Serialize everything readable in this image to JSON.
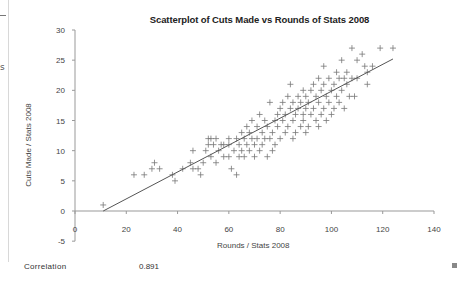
{
  "chart_data": {
    "type": "scatter",
    "title": "Scatterplot of Cuts Made vs Rounds of Stats 2008",
    "xlabel": "Rounds / Stats 2008",
    "ylabel": "Cuts Made / Stats 2008",
    "xlim": [
      0,
      140
    ],
    "ylim": [
      -5,
      30
    ],
    "xticks": [
      0,
      20,
      40,
      60,
      80,
      100,
      120,
      140
    ],
    "yticks": [
      -5,
      0,
      5,
      10,
      15,
      20,
      25,
      30
    ],
    "grid": false,
    "legend": null,
    "marker": "plus",
    "trendline": {
      "x": [
        11,
        124
      ],
      "y": [
        0,
        25.2
      ]
    },
    "points": [
      [
        11,
        1
      ],
      [
        23,
        6
      ],
      [
        27,
        6
      ],
      [
        30,
        7
      ],
      [
        31,
        8
      ],
      [
        33,
        7
      ],
      [
        38,
        6
      ],
      [
        39,
        5
      ],
      [
        42,
        7
      ],
      [
        45,
        8
      ],
      [
        46,
        10
      ],
      [
        46,
        7
      ],
      [
        48,
        7
      ],
      [
        49,
        6
      ],
      [
        50,
        8
      ],
      [
        51,
        10
      ],
      [
        52,
        11
      ],
      [
        52,
        12
      ],
      [
        53,
        9
      ],
      [
        53,
        12
      ],
      [
        54,
        11
      ],
      [
        55,
        8
      ],
      [
        55,
        12
      ],
      [
        56,
        10
      ],
      [
        57,
        11
      ],
      [
        58,
        9
      ],
      [
        58,
        11
      ],
      [
        60,
        11
      ],
      [
        60,
        12
      ],
      [
        60,
        9
      ],
      [
        61,
        7
      ],
      [
        62,
        10
      ],
      [
        63,
        6
      ],
      [
        63,
        12
      ],
      [
        64,
        11
      ],
      [
        64,
        9
      ],
      [
        65,
        13
      ],
      [
        65,
        10
      ],
      [
        66,
        12
      ],
      [
        66,
        9
      ],
      [
        67,
        14
      ],
      [
        67,
        11
      ],
      [
        68,
        13
      ],
      [
        68,
        10
      ],
      [
        69,
        12
      ],
      [
        69,
        15
      ],
      [
        70,
        11
      ],
      [
        70,
        9
      ],
      [
        71,
        14
      ],
      [
        71,
        12
      ],
      [
        72,
        16
      ],
      [
        72,
        10
      ],
      [
        73,
        13
      ],
      [
        73,
        11
      ],
      [
        74,
        12
      ],
      [
        74,
        15
      ],
      [
        75,
        9
      ],
      [
        75,
        14
      ],
      [
        76,
        18
      ],
      [
        76,
        12
      ],
      [
        77,
        13
      ],
      [
        77,
        10
      ],
      [
        78,
        15
      ],
      [
        78,
        11
      ],
      [
        79,
        16
      ],
      [
        79,
        14
      ],
      [
        80,
        17
      ],
      [
        80,
        12
      ],
      [
        81,
        18
      ],
      [
        81,
        15
      ],
      [
        82,
        13
      ],
      [
        82,
        16
      ],
      [
        83,
        19
      ],
      [
        83,
        14
      ],
      [
        84,
        17
      ],
      [
        84,
        21
      ],
      [
        85,
        15
      ],
      [
        85,
        18
      ],
      [
        85,
        12
      ],
      [
        86,
        16
      ],
      [
        86,
        13
      ],
      [
        87,
        19
      ],
      [
        87,
        17
      ],
      [
        88,
        18
      ],
      [
        88,
        14
      ],
      [
        89,
        15
      ],
      [
        89,
        20
      ],
      [
        89,
        16
      ],
      [
        90,
        19
      ],
      [
        90,
        17
      ],
      [
        90,
        13
      ],
      [
        91,
        18
      ],
      [
        91,
        14
      ],
      [
        92,
        20
      ],
      [
        92,
        16
      ],
      [
        93,
        21
      ],
      [
        93,
        17
      ],
      [
        94,
        15
      ],
      [
        94,
        19
      ],
      [
        95,
        22
      ],
      [
        95,
        18
      ],
      [
        95,
        14
      ],
      [
        96,
        16
      ],
      [
        96,
        20
      ],
      [
        97,
        17
      ],
      [
        97,
        21
      ],
      [
        97,
        24
      ],
      [
        98,
        19
      ],
      [
        98,
        15
      ],
      [
        99,
        22
      ],
      [
        99,
        18
      ],
      [
        100,
        20
      ],
      [
        100,
        16
      ],
      [
        101,
        21
      ],
      [
        101,
        17
      ],
      [
        102,
        19
      ],
      [
        102,
        23
      ],
      [
        103,
        22
      ],
      [
        103,
        18
      ],
      [
        104,
        20
      ],
      [
        104,
        25
      ],
      [
        105,
        17
      ],
      [
        105,
        22
      ],
      [
        106,
        21
      ],
      [
        106,
        23
      ],
      [
        107,
        19
      ],
      [
        108,
        27
      ],
      [
        108,
        22
      ],
      [
        109,
        19
      ],
      [
        110,
        25
      ],
      [
        110,
        22
      ],
      [
        112,
        26
      ],
      [
        113,
        24
      ],
      [
        114,
        23
      ],
      [
        114,
        21
      ],
      [
        116,
        24
      ],
      [
        119,
        27
      ],
      [
        124,
        27
      ]
    ]
  },
  "summary": {
    "correlation_label": "Correlation",
    "correlation_value": "0.891"
  },
  "fragments": {
    "left_text": "s"
  }
}
